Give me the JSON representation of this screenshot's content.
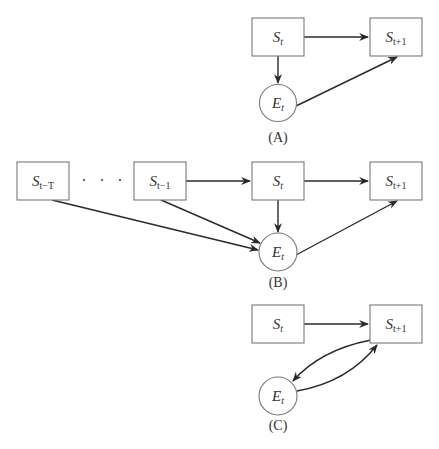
{
  "diagrams": [
    {
      "id": "A",
      "caption": "(A)",
      "nodes": [
        {
          "key": "st",
          "shape": "rect",
          "main": "S",
          "sub": "t"
        },
        {
          "key": "st1",
          "shape": "rect",
          "main": "S",
          "sub": "t+1"
        },
        {
          "key": "et",
          "shape": "circle",
          "main": "E",
          "sub": "t"
        }
      ],
      "edges": [
        {
          "from": "S_t",
          "to": "S_t+1"
        },
        {
          "from": "S_t",
          "to": "E_t"
        },
        {
          "from": "E_t",
          "to": "S_t+1"
        }
      ]
    },
    {
      "id": "B",
      "caption": "(B)",
      "nodes": [
        {
          "key": "stT",
          "shape": "rect",
          "main": "S",
          "sub": "t−T"
        },
        {
          "key": "st_1",
          "shape": "rect",
          "main": "S",
          "sub": "t−1"
        },
        {
          "key": "st",
          "shape": "rect",
          "main": "S",
          "sub": "t"
        },
        {
          "key": "st1",
          "shape": "rect",
          "main": "S",
          "sub": "t+1"
        },
        {
          "key": "et",
          "shape": "circle",
          "main": "E",
          "sub": "t"
        }
      ],
      "ellipsis": "· · ·",
      "edges": [
        {
          "from": "S_t-1",
          "to": "S_t"
        },
        {
          "from": "S_t",
          "to": "S_t+1"
        },
        {
          "from": "S_t",
          "to": "E_t"
        },
        {
          "from": "S_t-T",
          "to": "E_t"
        },
        {
          "from": "S_t-1",
          "to": "E_t"
        },
        {
          "from": "E_t",
          "to": "S_t+1"
        }
      ]
    },
    {
      "id": "C",
      "caption": "(C)",
      "nodes": [
        {
          "key": "st",
          "shape": "rect",
          "main": "S",
          "sub": "t"
        },
        {
          "key": "st1",
          "shape": "rect",
          "main": "S",
          "sub": "t+1"
        },
        {
          "key": "et",
          "shape": "circle",
          "main": "E",
          "sub": "t"
        }
      ],
      "edges": [
        {
          "from": "S_t",
          "to": "S_t+1"
        },
        {
          "from": "S_t+1",
          "to": "E_t",
          "curved": true
        },
        {
          "from": "E_t",
          "to": "S_t+1",
          "curved": true
        }
      ]
    }
  ],
  "colors": {
    "node_stroke": "#7a7a7a",
    "edge": "#2a2a2a",
    "text": "#333333"
  }
}
